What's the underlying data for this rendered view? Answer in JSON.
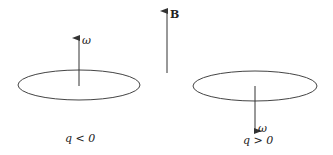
{
  "diagram": {
    "type": "physics-schematic",
    "colors": {
      "stroke": "#333333",
      "text": "#222222",
      "background": "#ffffff"
    },
    "field": {
      "label": "B",
      "direction": "up"
    },
    "left": {
      "omega_label": "ω",
      "omega_direction": "up",
      "charge_label": "q < 0"
    },
    "right": {
      "omega_label": "ω",
      "omega_direction": "down",
      "charge_label": "q > 0"
    }
  }
}
